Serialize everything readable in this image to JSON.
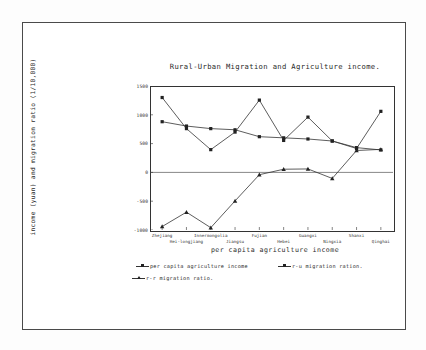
{
  "chart_data": {
    "type": "line",
    "title": "Rural-Urban Migration and Agriculture income.",
    "xlabel": "per capita agriculture income",
    "ylabel": "income (yuan) and migration ratio (1/10,000)",
    "categories": [
      "Zhejiang",
      "Hei-longjiang",
      "Innermongolia",
      "Jiangsu",
      "Fujian",
      "Hebei",
      "Guangxi",
      "Ningxia",
      "Shanxi",
      "Qinghai"
    ],
    "ylim": [
      -1000,
      1500
    ],
    "yticks": [
      1500,
      1000,
      500,
      0,
      -500,
      -1000
    ],
    "ytick_labels": [
      "1500",
      "1000",
      "500",
      "0",
      "-500",
      "-1000"
    ],
    "grid": false,
    "legend_position": "below-axes",
    "series": [
      {
        "name": "per capita agriculture income",
        "marker": "square",
        "values": [
          880,
          805,
          760,
          740,
          620,
          600,
          580,
          545,
          430,
          390
        ]
      },
      {
        "name": "r-u migration ration.",
        "marker": "square",
        "values": [
          1300,
          760,
          395,
          700,
          1255,
          555,
          960,
          545,
          415,
          1060
        ]
      },
      {
        "name": "r-r migration ratio.",
        "marker": "triangle",
        "values": [
          -940,
          -690,
          -960,
          -495,
          -40,
          55,
          60,
          -105,
          380,
          400
        ]
      }
    ]
  },
  "legend": {
    "items": [
      {
        "label": "per capita agriculture income",
        "marker": "square"
      },
      {
        "label": "r-u migration ration.",
        "marker": "square"
      },
      {
        "label": "r-r migration ratio.",
        "marker": "triangle"
      }
    ]
  }
}
